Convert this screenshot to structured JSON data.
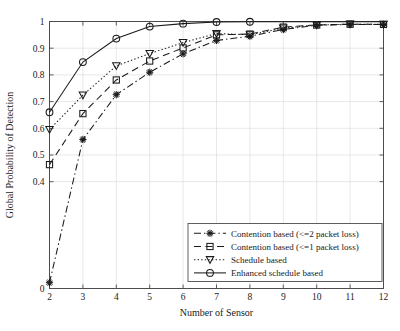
{
  "chart_data": {
    "type": "line",
    "title": "",
    "xlabel": "Number of Sensor",
    "ylabel": "Global Probability of Detection",
    "x": [
      2,
      3,
      4,
      5,
      6,
      7,
      8,
      9,
      10,
      11,
      12
    ],
    "xlim": [
      2,
      12
    ],
    "ylim": [
      0,
      1
    ],
    "xticks": [
      "2",
      "3",
      "4",
      "5",
      "6",
      "7",
      "8",
      "9",
      "10",
      "11",
      "12"
    ],
    "yticks": [
      "0",
      "0.4",
      "0.5",
      "0.6",
      "0.7",
      "0.8",
      "0.9",
      "1"
    ],
    "ytick_values": [
      0,
      0.4,
      0.5,
      0.6,
      0.7,
      0.8,
      0.9,
      1
    ],
    "grid": true,
    "legend_position": "lower right",
    "series": [
      {
        "name": "Contention based (<=2 packet loss)",
        "marker": "asterisk",
        "linestyle": "dashdot",
        "color": "#1a1a1a",
        "values": [
          0.022,
          0.558,
          0.726,
          0.81,
          0.879,
          0.929,
          0.945,
          0.97,
          0.986,
          0.989,
          0.989
        ]
      },
      {
        "name": "Contention based (<=1 packet loss)",
        "marker": "square",
        "linestyle": "dashed",
        "color": "#1a1a1a",
        "values": [
          0.464,
          0.655,
          0.781,
          0.852,
          0.901,
          0.95,
          0.953,
          0.979,
          0.987,
          0.99,
          0.989
        ]
      },
      {
        "name": "Schedule based",
        "marker": "triangle-down",
        "linestyle": "dotted",
        "color": "#1a1a1a",
        "values": [
          0.595,
          0.724,
          0.834,
          0.88,
          0.921,
          0.955,
          0.95,
          0.975,
          0.987,
          0.99,
          0.989
        ]
      },
      {
        "name": "Enhanced schedule based",
        "marker": "circle",
        "linestyle": "solid",
        "color": "#1a1a1a",
        "values": [
          0.66,
          0.848,
          0.936,
          0.981,
          0.992,
          0.998,
          0.999,
          0.999,
          0.999,
          0.999,
          0.999
        ],
        "marker_last_index": 6
      }
    ]
  }
}
